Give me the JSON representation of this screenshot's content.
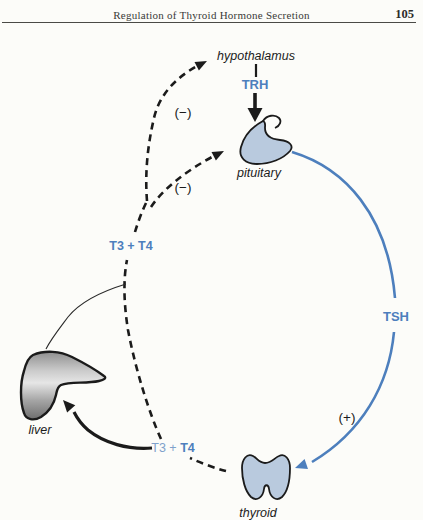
{
  "header": {
    "title": "Regulation of Thyroid Hormone Secretion",
    "page_number": "105"
  },
  "colors": {
    "accent_blue": "#4d7fbd",
    "gland_fill": "#b9cade",
    "ink": "#1b1b1b",
    "paper": "#fcfcf9",
    "t3_light": "#7fa1cb"
  },
  "diagram": {
    "labels": {
      "hypothalamus": "hypothalamus",
      "pituitary": "pituitary",
      "thyroid": "thyroid",
      "liver": "liver"
    },
    "hormones": {
      "trh": "TRH",
      "tsh": "TSH",
      "t3t4_feedback": "T3 + T4",
      "t3t4_peripheral_prefix": "T3 + ",
      "t3t4_peripheral_bold": "T4"
    },
    "signs": {
      "inhibit_hypothalamus": "(−)",
      "inhibit_pituitary": "(−)",
      "stimulate_thyroid": "(+)"
    }
  }
}
